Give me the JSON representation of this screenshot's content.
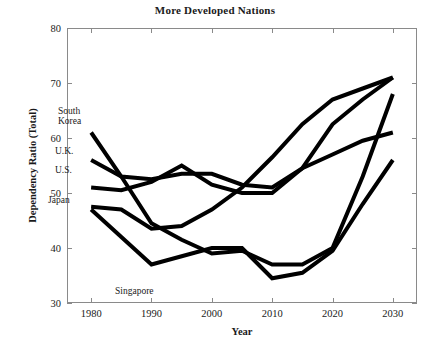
{
  "chart_data": {
    "type": "line",
    "title": "More Developed Nations",
    "xlabel": "Year",
    "ylabel": "Dependency Ratio (Total)",
    "xlim": [
      1976,
      2034
    ],
    "ylim": [
      30,
      80
    ],
    "xticks": [
      1980,
      1990,
      2000,
      2010,
      2020,
      2030
    ],
    "yticks": [
      30,
      40,
      50,
      60,
      70,
      80
    ],
    "grid": false,
    "legend_position": "inline-labels",
    "line_color": "#000000",
    "line_width": 4,
    "x": [
      1980,
      1985,
      1990,
      1995,
      2000,
      2005,
      2010,
      2015,
      2020,
      2025,
      2030
    ],
    "series": [
      {
        "name": "South Korea",
        "label": "South\nKorea",
        "values": [
          61.0,
          53.0,
          44.5,
          41.5,
          39.0,
          39.5,
          37.0,
          37.0,
          40.0,
          53.0,
          68.0
        ]
      },
      {
        "name": "U.K.",
        "label": "U.K.",
        "values": [
          56.0,
          53.0,
          52.5,
          53.5,
          53.5,
          51.5,
          51.0,
          54.5,
          57.0,
          59.5,
          61.0
        ]
      },
      {
        "name": "U.S.",
        "label": "U.S.",
        "values": [
          51.0,
          50.5,
          52.0,
          55.0,
          51.5,
          50.0,
          50.0,
          54.5,
          62.5,
          67.0,
          71.0
        ]
      },
      {
        "name": "Japan",
        "label": "Japan",
        "values": [
          47.5,
          47.0,
          43.5,
          44.0,
          47.0,
          51.0,
          56.5,
          62.5,
          67.0,
          69.0,
          71.0
        ]
      },
      {
        "name": "Singapore",
        "label": "Singapore",
        "values": [
          47.0,
          42.0,
          37.0,
          38.5,
          40.0,
          40.0,
          34.5,
          35.5,
          39.5,
          48.0,
          56.0
        ]
      }
    ],
    "series_labels": [
      {
        "name": "South Korea",
        "text": "South\nKorea",
        "x_px": 58,
        "y_px": 107
      },
      {
        "name": "U.K.",
        "text": "U.K.",
        "x_px": 55,
        "y_px": 147
      },
      {
        "name": "U.S.",
        "text": "U.S.",
        "x_px": 55,
        "y_px": 166
      },
      {
        "name": "Japan",
        "text": "Japan",
        "x_px": 48,
        "y_px": 196
      },
      {
        "name": "Singapore",
        "text": "Singapore",
        "x_px": 115,
        "y_px": 287
      }
    ]
  }
}
